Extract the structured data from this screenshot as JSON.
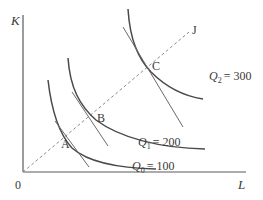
{
  "diagram": {
    "type": "isoquant-map",
    "axes": {
      "y_label": "K",
      "x_label": "L",
      "origin_label": "0"
    },
    "ray": {
      "label": "J",
      "style": "dashed"
    },
    "points": [
      {
        "id": "A",
        "label": "A"
      },
      {
        "id": "B",
        "label": "B"
      },
      {
        "id": "C",
        "label": "C"
      }
    ],
    "isoquants": [
      {
        "name": "Q",
        "subscript": "0",
        "value": "= 100",
        "point": "A"
      },
      {
        "name": "Q",
        "subscript": "1",
        "value": "= 200",
        "point": "B"
      },
      {
        "name": "Q",
        "subscript": "2",
        "value": "= 300",
        "point": "C"
      }
    ],
    "colors": {
      "curve": "#4a4a4a",
      "tangent": "#6a6a6a",
      "axis": "#5a5a5a",
      "ray": "#8a8a8a",
      "text": "#3a3a3a"
    }
  }
}
